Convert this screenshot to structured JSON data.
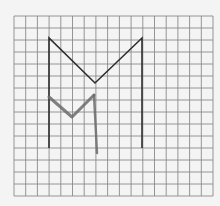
{
  "figure": {
    "background_color": "#f4f4f4",
    "grid": {
      "x0": 14,
      "y0": 16,
      "x1": 213,
      "y1": 196,
      "columns": 17,
      "rows": 15,
      "line_color": "#8a8a8a"
    },
    "large_letter": {
      "label": "M",
      "stroke_color": "#2e2e2e",
      "stroke_width": 1.6,
      "points": [
        [
          49,
          148
        ],
        [
          49,
          38
        ],
        [
          95,
          83
        ],
        [
          142,
          38
        ],
        [
          142,
          148
        ]
      ]
    },
    "small_letter": {
      "label": "M",
      "stroke_color": "#6b6b6b",
      "stroke_width": 3,
      "left_diagonal": [
        [
          49,
          97
        ],
        [
          72,
          117
        ],
        [
          94,
          95
        ]
      ],
      "right_leg": [
        [
          94,
          95
        ],
        [
          97,
          153
        ]
      ]
    }
  }
}
